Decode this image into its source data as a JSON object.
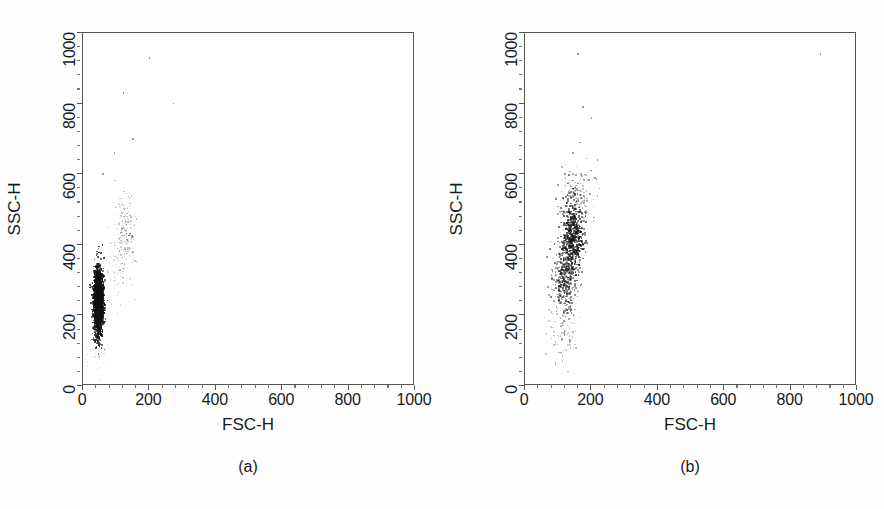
{
  "figure": {
    "background_color": "#ffffff",
    "point_color": "#111111",
    "axis_color": "#555555",
    "width": 884,
    "height": 509
  },
  "panels": [
    {
      "id": "a",
      "caption": "(a)",
      "xlabel": "FSC-H",
      "ylabel": "SSC-H"
    },
    {
      "id": "b",
      "caption": "(b)",
      "xlabel": "FSC-H",
      "ylabel": "SSC-H"
    }
  ],
  "chart_data": [
    {
      "type": "scatter",
      "panel": "a",
      "title": "(a)",
      "xlabel": "FSC-H",
      "ylabel": "SSC-H",
      "xlim": [
        0,
        1000
      ],
      "ylim": [
        0,
        1000
      ],
      "xticks": [
        0,
        200,
        400,
        600,
        800,
        1000
      ],
      "yticks": [
        0,
        200,
        400,
        600,
        800,
        1000
      ],
      "xtick_labels": [
        "0",
        "200",
        "400",
        "600",
        "800",
        "1000"
      ],
      "ytick_labels": [
        "0",
        "200",
        "400",
        "600",
        "800",
        "1000"
      ],
      "minor_ticks_per_interval": 4,
      "grid": false,
      "legend": false,
      "marker": "dot",
      "populations": [
        {
          "name": "main-dense-cluster",
          "description": "very dense narrow vertical cluster, saturated black",
          "approx_n": 2400,
          "x_center": 47,
          "y_center": 240,
          "x_spread": 7,
          "y_spread": 45,
          "density": "saturated",
          "opacity": 1.0,
          "size": 1.6
        },
        {
          "name": "secondary-faint-population",
          "description": "faint granular population above and right of main cluster",
          "approx_n": 160,
          "x_center": 130,
          "y_center": 440,
          "x_spread": 16,
          "y_spread": 45,
          "density": "sparse",
          "opacity": 0.35,
          "size": 1.3
        },
        {
          "name": "faint-bridge",
          "description": "sparse faint points bridging main cluster to secondary",
          "approx_n": 110,
          "x_center": 105,
          "y_center": 330,
          "x_spread": 20,
          "y_spread": 55,
          "density": "very-sparse",
          "opacity": 0.22,
          "size": 1.2
        },
        {
          "name": "low-debris",
          "description": "scattered debris near origin below main cluster",
          "approx_n": 45,
          "x_center": 40,
          "y_center": 70,
          "x_spread": 22,
          "y_spread": 45,
          "density": "very-sparse",
          "opacity": 0.2,
          "size": 1.2
        }
      ],
      "outliers": [
        {
          "x": 122,
          "y": 830
        },
        {
          "x": 200,
          "y": 930
        },
        {
          "x": 273,
          "y": 800
        },
        {
          "x": 60,
          "y": 600
        },
        {
          "x": 95,
          "y": 660
        },
        {
          "x": 150,
          "y": 700
        }
      ]
    },
    {
      "type": "scatter",
      "panel": "b",
      "title": "(b)",
      "xlabel": "FSC-H",
      "ylabel": "SSC-H",
      "xlim": [
        0,
        1000
      ],
      "ylim": [
        0,
        1000
      ],
      "xticks": [
        0,
        200,
        400,
        600,
        800,
        1000
      ],
      "yticks": [
        0,
        200,
        400,
        600,
        800,
        1000
      ],
      "xtick_labels": [
        "0",
        "200",
        "400",
        "600",
        "800",
        "1000"
      ],
      "ytick_labels": [
        "0",
        "200",
        "400",
        "600",
        "800",
        "1000"
      ],
      "minor_ticks_per_interval": 4,
      "grid": false,
      "legend": false,
      "marker": "dot",
      "populations": [
        {
          "name": "main-cluster-core",
          "description": "moderately dense granular cluster, discrete dots visible",
          "approx_n": 520,
          "x_center": 145,
          "y_center": 420,
          "x_spread": 16,
          "y_spread": 50,
          "density": "dense",
          "opacity": 0.85,
          "size": 1.8
        },
        {
          "name": "lower-tail",
          "description": "elongated lower tail of cluster extending down-left",
          "approx_n": 380,
          "x_center": 120,
          "y_center": 300,
          "x_spread": 18,
          "y_spread": 52,
          "density": "medium",
          "opacity": 0.6,
          "size": 1.7
        },
        {
          "name": "upper-halo",
          "description": "diffuse halo above the core",
          "approx_n": 140,
          "x_center": 155,
          "y_center": 530,
          "x_spread": 24,
          "y_spread": 45,
          "density": "sparse",
          "opacity": 0.45,
          "size": 1.6
        },
        {
          "name": "low-debris",
          "description": "sparse debris below the main cluster",
          "approx_n": 70,
          "x_center": 110,
          "y_center": 150,
          "x_spread": 28,
          "y_spread": 45,
          "density": "very-sparse",
          "opacity": 0.35,
          "size": 1.5
        }
      ],
      "outliers": [
        {
          "x": 160,
          "y": 940
        },
        {
          "x": 890,
          "y": 940
        },
        {
          "x": 175,
          "y": 790
        },
        {
          "x": 200,
          "y": 760
        },
        {
          "x": 165,
          "y": 690
        },
        {
          "x": 145,
          "y": 660
        },
        {
          "x": 185,
          "y": 645
        },
        {
          "x": 218,
          "y": 640
        },
        {
          "x": 198,
          "y": 610
        },
        {
          "x": 210,
          "y": 590
        },
        {
          "x": 225,
          "y": 560
        },
        {
          "x": 100,
          "y": 570
        },
        {
          "x": 120,
          "y": 600
        }
      ]
    }
  ]
}
